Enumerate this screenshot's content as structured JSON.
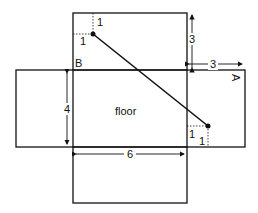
{
  "diagram": {
    "type": "unfolded-box-net",
    "labels": {
      "floor": "floor",
      "corner_a": "A",
      "corner_b": "B"
    },
    "dimensions": {
      "height_top": "3",
      "width_right_flap": "3",
      "floor_depth": "4",
      "floor_width": "6"
    },
    "offsets": {
      "start_dx": "1",
      "start_dy": "1",
      "end_dx": "1",
      "end_dy": "1"
    },
    "colors": {
      "line": "#111111",
      "background": "#ffffff"
    }
  }
}
